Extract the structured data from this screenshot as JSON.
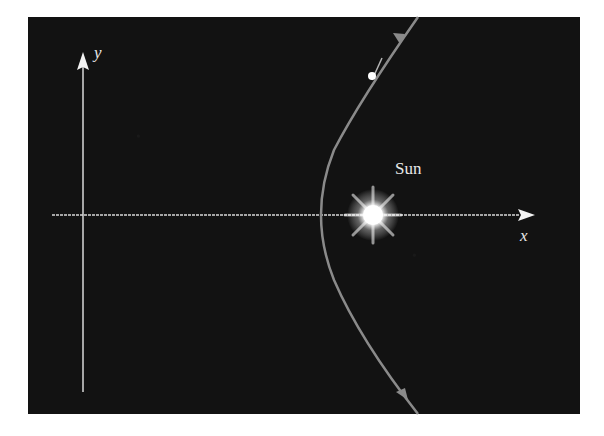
{
  "figure": {
    "axes": {
      "x_label": "x",
      "y_label": "y"
    },
    "sun_label": "Sun",
    "colors": {
      "background": "#121212",
      "axis": "#d8d8d8",
      "orbit": "#8a8a8a",
      "sun": "#ffffff"
    }
  }
}
